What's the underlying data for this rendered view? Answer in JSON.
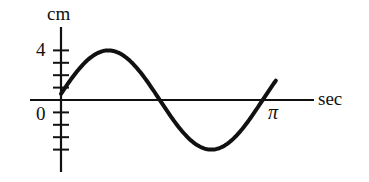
{
  "chart_data": {
    "type": "line",
    "title": "",
    "ylabel": "cm",
    "xlabel": "sec",
    "y_tick_labels": [
      {
        "value": 4,
        "label": "4"
      },
      {
        "value": 0,
        "label": "0"
      }
    ],
    "x_tick_labels": [
      {
        "value": 3.14159,
        "label": "π"
      }
    ],
    "y_ticks": [
      -4,
      -3,
      -2,
      -1,
      1,
      2,
      3,
      4
    ],
    "ylim": [
      -5.8,
      5.8
    ],
    "xlim": [
      -0.5,
      4.0
    ],
    "series": [
      {
        "name": "displacement",
        "equation": "y = 4 sin(2t + 0.125)",
        "amplitude": 4,
        "angular_frequency": 2,
        "phase": 0.125,
        "t_range": [
          0,
          3.28
        ],
        "x": [
          0,
          0.25,
          0.5,
          0.75,
          1.0,
          1.25,
          1.5,
          1.75,
          2.0,
          2.25,
          2.5,
          2.75,
          3.0,
          3.25
        ],
        "values": [
          0.5,
          2.37,
          3.57,
          3.99,
          3.54,
          2.29,
          0.41,
          -1.54,
          -3.09,
          -3.94,
          -3.9,
          -2.94,
          -1.28,
          0.7
        ]
      }
    ],
    "grid": false,
    "legend": null
  },
  "labels": {
    "y_unit": "cm",
    "x_unit": "sec",
    "y_four": "4",
    "origin": "0",
    "x_pi": "π"
  }
}
